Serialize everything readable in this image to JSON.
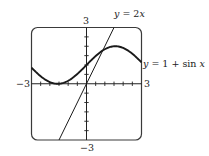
{
  "chart_data": {
    "type": "line",
    "title": "",
    "xlabel": "",
    "ylabel": "",
    "xlim": [
      -3,
      3
    ],
    "ylim": [
      -3,
      3
    ],
    "grid": false,
    "ticks": {
      "x_step": 0.5,
      "y_step": 0.5
    },
    "tick_labels": {
      "x_min": "−3",
      "x_max": "3",
      "y_min": "−3",
      "y_max": "3"
    },
    "series": [
      {
        "name": "y = 2x",
        "expression": "2x",
        "x": [
          -1.5,
          -1,
          -0.5,
          0,
          0.5,
          1,
          1.5
        ],
        "y": [
          -3,
          -2,
          -1,
          0,
          1,
          2,
          3
        ]
      },
      {
        "name": "y = 1 + sin x",
        "expression": "1 + sin(x)",
        "x": [
          -3,
          -2.5,
          -2,
          -1.5,
          -1,
          -0.5,
          0,
          0.5,
          1,
          1.5,
          2,
          2.5,
          3
        ],
        "y": [
          0.86,
          0.4,
          0.09,
          0.0,
          0.16,
          0.52,
          1.0,
          1.48,
          1.84,
          2.0,
          1.91,
          1.6,
          1.14
        ]
      }
    ],
    "annotations": [
      {
        "text": "y = 2x",
        "near": "top of line y=2x"
      },
      {
        "text": "y = 1 + sin x",
        "near": "right edge of sine curve"
      }
    ]
  },
  "labels": {
    "y_top": "3",
    "y_bottom": "−3",
    "x_left": "−3",
    "x_right": "3",
    "line_label_prefix": "y",
    "line_label_rest": " = 2",
    "line_label_var": "x",
    "sine_label_prefix": "y",
    "sine_label_rest": " = 1 + sin ",
    "sine_label_var": "x"
  },
  "colors": {
    "frame": "#3a3a3a",
    "axes": "#222222",
    "curve": "#1a1a1a",
    "background": "#ffffff"
  }
}
